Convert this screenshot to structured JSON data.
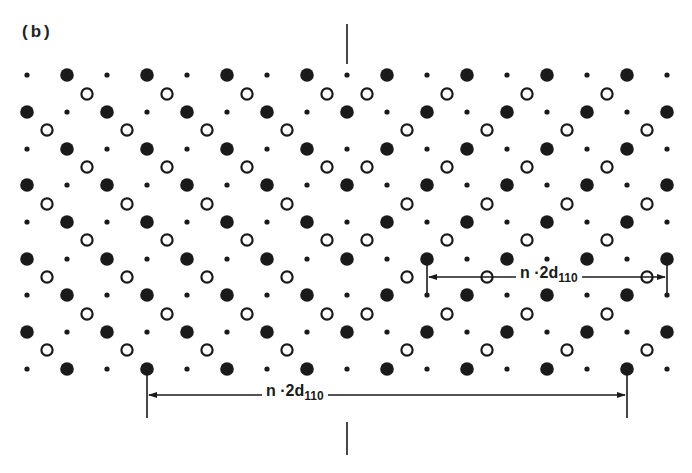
{
  "figure": {
    "panel_label": "(b)",
    "header_text": "",
    "colors": {
      "ink": "#1a1a1a",
      "background": "#ffffff"
    }
  },
  "lattice": {
    "description": "Crystal lattice projection with mirror twin boundary",
    "mirror_x": 347,
    "row_types_order": [
      "A",
      "B",
      "C",
      "D"
    ],
    "row_ys": [
      75,
      94,
      112,
      130,
      149,
      167,
      185,
      204,
      222,
      240,
      259,
      277,
      295,
      314,
      332,
      350,
      369
    ],
    "rows": {
      "A": {
        "small": [
          27,
          107,
          187,
          267,
          347,
          427,
          507,
          587,
          667
        ],
        "large": [
          67,
          147,
          227,
          307,
          387,
          467,
          547,
          627
        ],
        "open": []
      },
      "B": {
        "small": [],
        "large": [],
        "open": [
          87,
          167,
          247,
          327,
          367,
          447,
          527,
          607
        ]
      },
      "C": {
        "small": [
          67,
          147,
          227,
          307,
          387,
          467,
          547,
          627
        ],
        "large": [
          27,
          107,
          187,
          267,
          347,
          427,
          507,
          587,
          667
        ],
        "open": []
      },
      "D": {
        "small": [],
        "large": [],
        "open": [
          47,
          127,
          207,
          287,
          407,
          487,
          567,
          647
        ]
      }
    },
    "atom_styles": {
      "small": {
        "r": 2.6,
        "fill": "#1a1a1a"
      },
      "large": {
        "r": 6.8,
        "fill": "#1a1a1a"
      },
      "open": {
        "r": 5.6,
        "stroke": "#1a1a1a",
        "stroke_width": 2.2
      }
    }
  },
  "twin_boundary_ticks": [
    {
      "x": 347,
      "y1": 24,
      "y2": 64
    },
    {
      "x": 347,
      "y1": 422,
      "y2": 455
    }
  ],
  "dimensions": [
    {
      "id": "upper",
      "x1": 427,
      "x2": 667,
      "y": 277,
      "tick_y1": 258,
      "tick_y2": 295,
      "label_main": "n ·2d",
      "label_sub": "110",
      "label_x": 516,
      "label_y": 264
    },
    {
      "id": "lower",
      "x1": 147,
      "x2": 627,
      "y": 395,
      "tick_y1": 369,
      "tick_y2": 418,
      "label_main": "n ·2d",
      "label_sub": "110",
      "label_x": 262,
      "label_y": 382
    }
  ]
}
